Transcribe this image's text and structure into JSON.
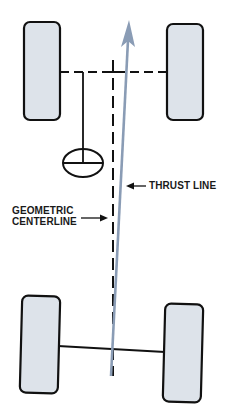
{
  "diagram": {
    "labels": {
      "thrust_line": "THRUST LINE",
      "geometric_line1": "GEOMETRIC",
      "geometric_line2": "CENTERLINE"
    },
    "colors": {
      "tire_fill": "#dde3ea",
      "outline": "#111111",
      "thrust_arrow": "#8a9cb5",
      "background": "#ffffff"
    },
    "components": [
      "front-left-wheel",
      "front-right-wheel",
      "rear-left-wheel",
      "rear-right-wheel",
      "front-axle",
      "rear-axle",
      "steering-column",
      "steering-wheel",
      "geometric-centerline",
      "thrust-line"
    ]
  }
}
